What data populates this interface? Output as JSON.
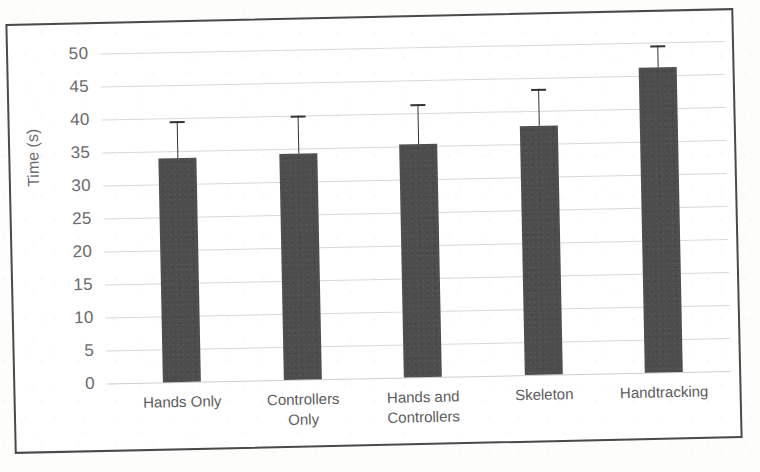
{
  "chart_data": {
    "type": "bar",
    "title": "",
    "xlabel": "",
    "ylabel": "Time (s)",
    "categories": [
      "Hands Only",
      "Controllers Only",
      "Hands and Controllers",
      "Skeleton",
      "Handtracking"
    ],
    "category_lines": [
      [
        "Hands Only"
      ],
      [
        "Controllers",
        "Only"
      ],
      [
        "Hands and",
        "Controllers"
      ],
      [
        "Skeleton"
      ],
      [
        "Handtracking"
      ]
    ],
    "values": [
      34.0,
      34.2,
      35.3,
      37.8,
      46.2
    ],
    "error_upper": [
      5.5,
      5.8,
      6.0,
      5.5,
      3.3
    ],
    "error_bar_tops": [
      39.5,
      40.0,
      41.3,
      43.3,
      49.5
    ],
    "ylim": [
      0,
      50
    ],
    "ytick_step": 5,
    "yticks": [
      50,
      45,
      40,
      35,
      30,
      25,
      20,
      15,
      10,
      5,
      0
    ],
    "ytick_labels": [
      "50",
      "45",
      "40",
      "35",
      "30",
      "25",
      "20",
      "15",
      "10",
      "5",
      "0"
    ],
    "grid": true,
    "grid_axis": "y",
    "legend": false,
    "legend_position": "none",
    "bar_color": "#4d4d4d",
    "error_bar_color": "#333333",
    "gridline_color": "#d9d9d6",
    "tick_label_color": "#6b6b6b",
    "frame_color": "#4a4a4a",
    "background_color": "#ffffff"
  }
}
